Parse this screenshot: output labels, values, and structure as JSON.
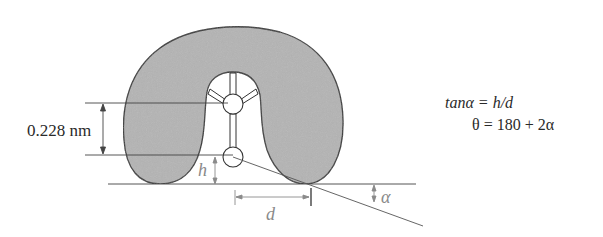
{
  "diagram": {
    "type": "contact-angle schematic",
    "dimension_label": "0.228 nm",
    "height_label": "h",
    "distance_label": "d",
    "angle_label": "α",
    "equations": [
      "tanα = h/d",
      "θ = 180 + 2α"
    ],
    "colors": {
      "drop_fill": "#b4b4b4",
      "outline": "#333333",
      "background": "#ffffff",
      "annotation": "#8a8a8a"
    }
  }
}
